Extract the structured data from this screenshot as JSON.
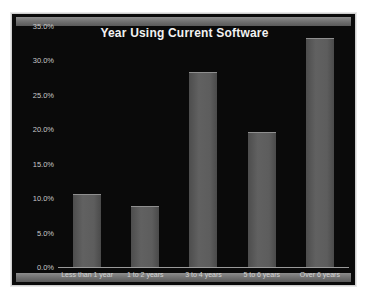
{
  "chart_data": {
    "type": "bar",
    "title": "Year Using Current Software",
    "xlabel": "",
    "ylabel": "",
    "categories": [
      "Less than 1 year",
      "1 to 2 years",
      "3 to 4 years",
      "5 to 6 years",
      "Over 6 years"
    ],
    "values": [
      10.6,
      8.9,
      28.3,
      19.6,
      33.3
    ],
    "ylim": [
      0,
      35
    ],
    "y_ticks": [
      0,
      5,
      10,
      15,
      20,
      25,
      30,
      35
    ],
    "y_tick_labels": [
      "0.0%",
      "5.0%",
      "10.0%",
      "15.0%",
      "20.0%",
      "25.0%",
      "30.0%",
      "35.0%"
    ],
    "grid": false,
    "legend": null,
    "bar_color": "#5a5a5a",
    "background_color": "#0a0a0a",
    "title_color": "#f2f2f2",
    "axis_text_color": "#c8c8c8"
  },
  "watermark": {
    "text": ""
  }
}
